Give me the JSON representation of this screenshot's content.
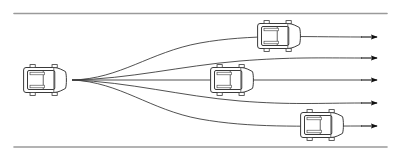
{
  "figure": {
    "name": "multi-modal-trajectory-prediction-diagram",
    "type": "diagram",
    "width": 402,
    "height": 156,
    "background_color": "#ffffff"
  },
  "road": {
    "name": "straight-road-segment",
    "boundary_color": "#9a9a9a",
    "boundary_width": 1.6,
    "top_boundary": {
      "x1": 14,
      "y1": 13.5,
      "x2": 387,
      "y2": 13.5
    },
    "bottom_boundary": {
      "x1": 14,
      "y1": 147,
      "x2": 387,
      "y2": 147
    }
  },
  "ego_vehicle": {
    "name": "ego-vehicle",
    "label": "ego vehicle",
    "cx": 45,
    "cy": 80,
    "length": 44,
    "width": 30,
    "heading_deg": 0,
    "outline_color": "#3a3a3a",
    "fill_color": "#ffffff"
  },
  "origin_point": {
    "x": 72,
    "y": 80
  },
  "trajectories": {
    "name": "predicted-trajectory-set",
    "count": 5,
    "stroke_color": "#3d3d3d",
    "stroke_width": 0.9,
    "arrow_color": "#111111",
    "items": [
      {
        "id": "trajectory-1",
        "label": "lane change left (far)",
        "end_y": 37,
        "path": "M72,80 C120,79 150,52 200,43 C250,34 300,37 362,37",
        "arrow_x": 377,
        "arrow_y": 37
      },
      {
        "id": "trajectory-2",
        "label": "lane change left (near)",
        "end_y": 58,
        "path": "M72,80 C130,79 180,66 240,61 C290,57 320,58 362,58",
        "arrow_x": 377,
        "arrow_y": 58
      },
      {
        "id": "trajectory-3",
        "label": "keep lane straight",
        "end_y": 80,
        "path": "M72,80 L362,80",
        "arrow_x": 377,
        "arrow_y": 80
      },
      {
        "id": "trajectory-4",
        "label": "lane change right (near)",
        "end_y": 103,
        "path": "M72,80 C130,82 180,96 240,101 C290,105 320,103 362,103",
        "arrow_x": 377,
        "arrow_y": 103
      },
      {
        "id": "trajectory-5",
        "label": "lane change right (far)",
        "end_y": 126,
        "path": "M72,80 C120,82 150,110 200,119 C250,128 300,126 362,126",
        "arrow_x": 377,
        "arrow_y": 126
      }
    ]
  },
  "target_vehicles": [
    {
      "id": "target-vehicle-upper",
      "name": "target-vehicle-upper",
      "label": "predicted position on trajectory 1",
      "cx": 279,
      "cy": 36,
      "length": 44,
      "width": 30,
      "outline_color": "#3a3a3a",
      "fill_color": "#ffffff"
    },
    {
      "id": "target-vehicle-middle",
      "name": "target-vehicle-middle",
      "label": "predicted position on trajectory 3",
      "cx": 232,
      "cy": 80,
      "length": 44,
      "width": 30,
      "outline_color": "#3a3a3a",
      "fill_color": "#ffffff"
    },
    {
      "id": "target-vehicle-lower",
      "name": "target-vehicle-lower",
      "label": "predicted position on trajectory 5",
      "cx": 322,
      "cy": 125,
      "length": 44,
      "width": 30,
      "outline_color": "#3a3a3a",
      "fill_color": "#ffffff"
    }
  ]
}
